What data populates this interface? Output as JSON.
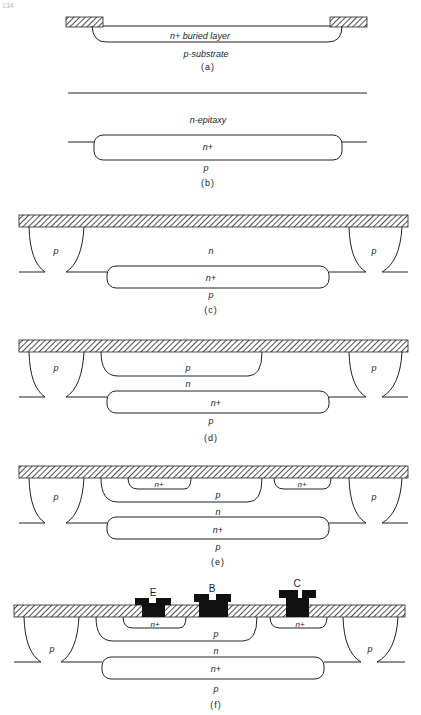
{
  "page_number": "134",
  "panels": [
    {
      "id": "a",
      "caption": "(a)",
      "labels": {
        "buried": "n+ buried layer",
        "substrate": "p-substrate"
      }
    },
    {
      "id": "b",
      "caption": "(b)",
      "labels": {
        "epi": "n-epitaxy",
        "buried": "n+",
        "substrate": "p"
      }
    },
    {
      "id": "c",
      "caption": "(c)",
      "labels": {
        "iso_left": "p",
        "iso_right": "p",
        "epi": "n",
        "buried": "n+",
        "substrate": "p"
      }
    },
    {
      "id": "d",
      "caption": "(d)",
      "labels": {
        "iso_left": "p",
        "iso_right": "p",
        "base": "p",
        "epi": "n",
        "buried": "n+",
        "substrate": "p"
      }
    },
    {
      "id": "e",
      "caption": "(e)",
      "labels": {
        "iso_left": "p",
        "iso_right": "p",
        "emitter": "n+",
        "collector_contact": "n+",
        "base": "p",
        "epi": "n",
        "buried": "n+",
        "substrate": "p"
      }
    },
    {
      "id": "f",
      "caption": "(f)",
      "labels": {
        "iso_left": "p",
        "iso_right": "p",
        "emitter": "n+",
        "collector_contact": "n+",
        "base": "p",
        "epi": "n",
        "buried": "n+",
        "substrate": "p",
        "terminal_e": "E",
        "terminal_b": "B",
        "terminal_c": "C"
      }
    }
  ],
  "colors": {
    "ink": "#222222",
    "background": "#ffffff",
    "metal": "#111111"
  }
}
